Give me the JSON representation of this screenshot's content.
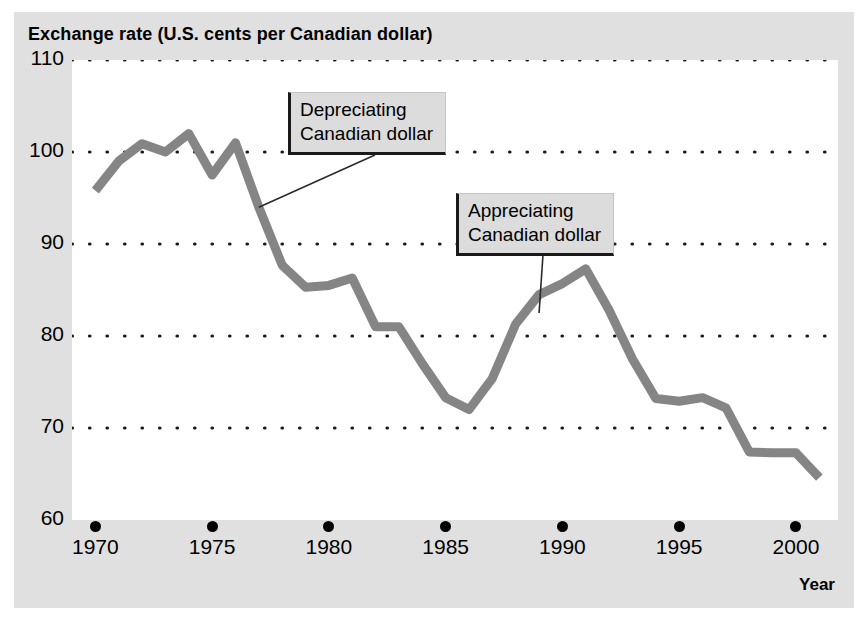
{
  "chart_data": {
    "type": "line",
    "title": "Exchange rate (U.S. cents per Canadian dollar)",
    "xlabel": "Year",
    "ylabel": "",
    "xlim": [
      1969,
      2001.8
    ],
    "ylim": [
      60,
      110
    ],
    "grid": true,
    "grid_style": "dotted-horizontal",
    "legend": "none",
    "y_ticks": [
      110,
      100,
      90,
      80,
      70,
      60
    ],
    "y_tick_labels": [
      "110",
      "100",
      "90",
      "80",
      "70",
      "60"
    ],
    "x_ticks": [
      1970,
      1975,
      1980,
      1985,
      1990,
      1995,
      2000
    ],
    "x_tick_labels": [
      "1970",
      "1975",
      "1980",
      "1985",
      "1990",
      "1995",
      "2000"
    ],
    "series": [
      {
        "name": "Exchange rate (U.S. cents per Canadian dollar)",
        "color": "#858585",
        "x": [
          1970,
          1971,
          1972,
          1973,
          1974,
          1975,
          1976,
          1977,
          1978,
          1979,
          1980,
          1981,
          1982,
          1983,
          1984,
          1985,
          1986,
          1987,
          1988,
          1989,
          1990,
          1991,
          1992,
          1993,
          1994,
          1995,
          1996,
          1997,
          1998,
          1999,
          2000,
          2001
        ],
        "values": [
          95.8,
          99.0,
          100.9,
          100.0,
          102.0,
          97.5,
          101.0,
          94.0,
          87.7,
          85.3,
          85.5,
          86.3,
          81.0,
          81.0,
          77.0,
          73.3,
          72.0,
          75.4,
          81.3,
          84.5,
          85.7,
          87.3,
          82.8,
          77.5,
          73.2,
          72.9,
          73.3,
          72.2,
          67.4,
          67.3,
          67.3,
          64.6
        ]
      }
    ],
    "annotations": [
      {
        "id": "depreciating",
        "lines": [
          "Depreciating",
          "Canadian dollar"
        ],
        "points_to_year": 1977,
        "points_to_value": 94.0
      },
      {
        "id": "appreciating",
        "lines": [
          "Appreciating",
          "Canadian dollar"
        ],
        "points_to_year": 1989,
        "points_to_value": 82.5
      }
    ]
  },
  "colors": {
    "panel_background": "#e0e0e0",
    "plot_background": "#ffffff",
    "line": "#858585",
    "grid_dot": "#1a1a1a",
    "text": "#000000",
    "callout_fill": "#dcdcdc",
    "callout_border": "#1a1a1a"
  }
}
